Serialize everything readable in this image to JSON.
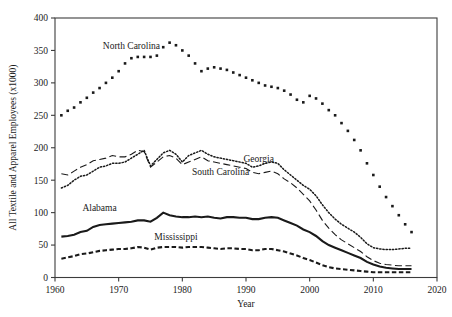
{
  "chart_data": {
    "type": "line",
    "title": "",
    "xlabel": "Year",
    "ylabel": "All Textile and Apparel Employees (x1000)",
    "xlim": [
      1960,
      2020
    ],
    "ylim": [
      0,
      400
    ],
    "xticks": [
      1960,
      1970,
      1980,
      1990,
      2000,
      2010,
      2020
    ],
    "xtick_labels": [
      "1960",
      "1970",
      "1980",
      "1990",
      "2000",
      "2010",
      "2020"
    ],
    "yticks": [
      0,
      50,
      100,
      150,
      200,
      250,
      300,
      350,
      400
    ],
    "ytick_labels": [
      "0",
      "50",
      "100",
      "150",
      "200",
      "250",
      "300",
      "350",
      "400"
    ],
    "grid": false,
    "legend_position": "inline-annotations",
    "x": [
      1961,
      1962,
      1963,
      1964,
      1965,
      1966,
      1967,
      1968,
      1969,
      1970,
      1971,
      1972,
      1973,
      1974,
      1975,
      1976,
      1977,
      1978,
      1979,
      1980,
      1981,
      1982,
      1983,
      1984,
      1985,
      1986,
      1987,
      1988,
      1989,
      1990,
      1991,
      1992,
      1993,
      1994,
      1995,
      1996,
      1997,
      1998,
      1999,
      2000,
      2001,
      2002,
      2003,
      2004,
      2005,
      2006,
      2007,
      2008,
      2009,
      2010,
      2011,
      2012,
      2013,
      2014,
      2015,
      2016
    ],
    "series": [
      {
        "name": "North Carolina",
        "style": "dotted-square-markers",
        "label_x": 1972,
        "label_y": 352,
        "values": [
          250,
          257,
          262,
          270,
          277,
          285,
          292,
          300,
          308,
          318,
          330,
          338,
          340,
          340,
          340,
          342,
          355,
          362,
          358,
          350,
          342,
          330,
          318,
          322,
          324,
          322,
          320,
          316,
          312,
          308,
          304,
          300,
          296,
          294,
          292,
          288,
          282,
          274,
          270,
          280,
          276,
          268,
          258,
          250,
          238,
          226,
          212,
          196,
          176,
          158,
          140,
          124,
          110,
          96,
          82,
          70
        ]
      },
      {
        "name": "Georgia",
        "style": "fine-dotted",
        "label_x": 1992,
        "label_y": 178,
        "values": [
          138,
          142,
          150,
          156,
          158,
          164,
          170,
          172,
          176,
          176,
          178,
          184,
          190,
          196,
          172,
          182,
          192,
          196,
          190,
          178,
          188,
          192,
          196,
          190,
          186,
          184,
          182,
          180,
          178,
          176,
          170,
          172,
          176,
          178,
          176,
          166,
          158,
          150,
          142,
          136,
          126,
          112,
          100,
          90,
          82,
          76,
          70,
          62,
          52,
          46,
          44,
          43,
          43,
          44,
          45,
          45
        ]
      },
      {
        "name": "South Carolina",
        "style": "long-dashed",
        "label_x": 1986,
        "label_y": 158,
        "values": [
          160,
          158,
          164,
          170,
          174,
          180,
          182,
          184,
          188,
          186,
          186,
          190,
          196,
          194,
          170,
          178,
          186,
          188,
          184,
          174,
          178,
          182,
          186,
          180,
          178,
          176,
          174,
          172,
          170,
          168,
          162,
          160,
          162,
          164,
          160,
          152,
          146,
          138,
          128,
          118,
          104,
          88,
          76,
          66,
          58,
          52,
          46,
          40,
          32,
          26,
          22,
          20,
          19,
          18,
          18,
          18
        ]
      },
      {
        "name": "Alabama",
        "style": "solid-bold",
        "label_x": 1967,
        "label_y": 102,
        "values": [
          63,
          64,
          66,
          70,
          72,
          78,
          81,
          82,
          83,
          84,
          85,
          86,
          88,
          88,
          86,
          92,
          100,
          96,
          94,
          93,
          93,
          94,
          93,
          94,
          92,
          91,
          93,
          93,
          92,
          92,
          90,
          90,
          92,
          93,
          92,
          88,
          84,
          80,
          74,
          70,
          64,
          56,
          50,
          46,
          42,
          38,
          34,
          30,
          24,
          20,
          17,
          15,
          14,
          13,
          13,
          13
        ]
      },
      {
        "name": "Mississippi",
        "style": "short-dashed",
        "label_x": 1979,
        "label_y": 58,
        "values": [
          29,
          31,
          33,
          36,
          37,
          39,
          41,
          42,
          43,
          44,
          44,
          45,
          47,
          46,
          43,
          46,
          47,
          47,
          47,
          46,
          47,
          47,
          47,
          46,
          45,
          44,
          45,
          45,
          44,
          44,
          42,
          42,
          44,
          44,
          42,
          40,
          37,
          34,
          30,
          27,
          23,
          19,
          16,
          14,
          13,
          12,
          11,
          10,
          9,
          8,
          8,
          8,
          8,
          8,
          8,
          8
        ]
      }
    ]
  }
}
